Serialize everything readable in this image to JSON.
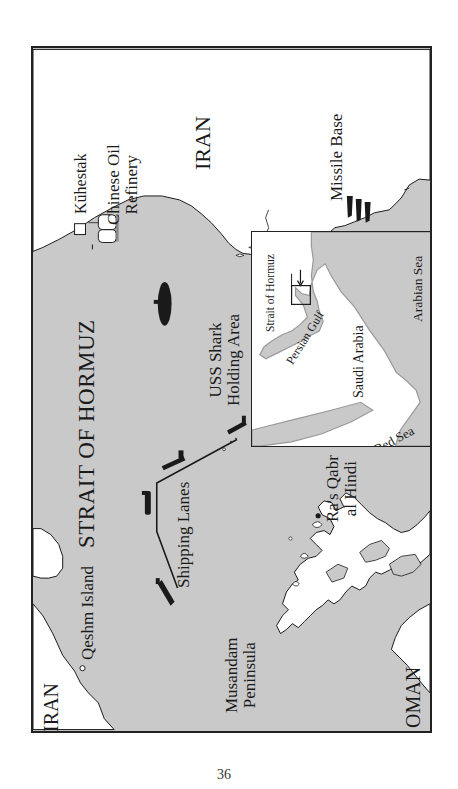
{
  "map": {
    "title": "STRAIT OF HORMUZ",
    "colors": {
      "sea": "#c9c9c9",
      "land": "#ffffff",
      "ink": "#1a1a1a",
      "border": "#222222"
    },
    "labels": {
      "iran_main": "IRAN",
      "iran_west": "IRAN",
      "oman": "OMAN",
      "kuhestak": "Kūhestak",
      "refinery_line1": "Chinese Oil",
      "refinery_line2": "Refinery",
      "missile_base": "Missile Base",
      "uss_shark_line1": "USS Shark",
      "uss_shark_line2": "Holding Area",
      "shipping_lanes": "Shipping Lanes",
      "qeshm_island": "Qeshm Island",
      "musandam_line1": "Musandam",
      "musandam_line2": "Peninsula",
      "ras_qabr_line1": "Ra's Qabr",
      "ras_qabr_line2": "al Hindi"
    },
    "icons": [
      "town-square-icon",
      "oil-refinery-icon",
      "missile-icon",
      "submarine-icon",
      "tanker-ship-icon",
      "location-dot-icon"
    ]
  },
  "inset": {
    "labels": {
      "strait_of_hormuz": "Strait of Hormuz",
      "persian_gulf": "Persian Gulf",
      "saudi_arabia": "Saudi Arabia",
      "arabian_sea": "Arabian Sea",
      "red_sea": "Red Sea"
    }
  },
  "page": {
    "number": "36"
  }
}
